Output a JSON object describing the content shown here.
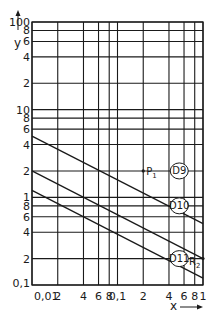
{
  "chart_data": {
    "type": "line",
    "title": "",
    "xlabel": "x",
    "ylabel": "y",
    "xscale": "log",
    "yscale": "log",
    "xlim": [
      0.01,
      1
    ],
    "ylim": [
      0.1,
      100
    ],
    "grid": true,
    "x_ticks": [
      {
        "value": 0.01,
        "label": "0,01"
      },
      {
        "value": 0.02,
        "label": "2"
      },
      {
        "value": 0.04,
        "label": "4"
      },
      {
        "value": 0.06,
        "label": "6"
      },
      {
        "value": 0.08,
        "label": "8"
      },
      {
        "value": 0.1,
        "label": "0,1"
      },
      {
        "value": 0.2,
        "label": "2"
      },
      {
        "value": 0.4,
        "label": "4"
      },
      {
        "value": 0.6,
        "label": "6"
      },
      {
        "value": 0.8,
        "label": "8"
      },
      {
        "value": 1,
        "label": "1"
      }
    ],
    "y_ticks": [
      {
        "value": 0.1,
        "label": "0,1"
      },
      {
        "value": 0.2,
        "label": "2"
      },
      {
        "value": 0.4,
        "label": "4"
      },
      {
        "value": 0.6,
        "label": "6"
      },
      {
        "value": 0.8,
        "label": "8"
      },
      {
        "value": 1,
        "label": "1"
      },
      {
        "value": 2,
        "label": "2"
      },
      {
        "value": 4,
        "label": "4"
      },
      {
        "value": 6,
        "label": "6"
      },
      {
        "value": 8,
        "label": "8"
      },
      {
        "value": 10,
        "label": "10"
      },
      {
        "value": 20,
        "label": "2"
      },
      {
        "value": 40,
        "label": "4"
      },
      {
        "value": 60,
        "label": "6"
      },
      {
        "value": 80,
        "label": "8"
      },
      {
        "value": 100,
        "label": "100"
      }
    ],
    "series": [
      {
        "name": "D9",
        "x": [
          0.01,
          1
        ],
        "y": [
          5,
          0.5
        ]
      },
      {
        "name": "D10",
        "x": [
          0.01,
          1
        ],
        "y": [
          2,
          0.2
        ]
      },
      {
        "name": "D11",
        "x": [
          0.01,
          1
        ],
        "y": [
          1.2,
          0.12
        ]
      }
    ],
    "annotations": [
      {
        "text": "P1",
        "x": 0.2,
        "y": 2,
        "series": "D10"
      },
      {
        "text": "R2",
        "x": 1,
        "y": 0.2,
        "series": "D10"
      }
    ],
    "series_labels": [
      {
        "text": "D9",
        "x": 0.5,
        "y": 2
      },
      {
        "text": "D10",
        "x": 0.5,
        "y": 0.8
      },
      {
        "text": "D11",
        "x": 0.5,
        "y": 0.2
      }
    ]
  },
  "axes": {
    "x_label": "x",
    "y_label": "y"
  }
}
